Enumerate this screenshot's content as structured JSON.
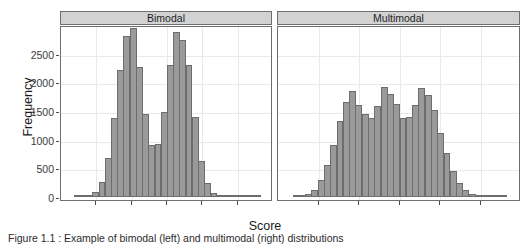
{
  "figure": {
    "x_axis_title": "Score",
    "y_axis_title": "Frequency",
    "caption": "Figure 1.1 : Example of bimodal (left) and multimodal (right) distributions",
    "colors": {
      "bar_fill": "#9a9a9a",
      "bar_border": "#6d6d6d",
      "strip_fill": "#d2d2d2",
      "panel_border": "#6e6e6e",
      "gridline": "#e9e9e9",
      "background": "#ffffff",
      "text": "#1a1a1a"
    }
  },
  "chart_data": {
    "type": "bar",
    "title": "",
    "xlabel": "Score",
    "ylabel": "Frequency",
    "ylim": [
      0,
      3000
    ],
    "yticks": [
      0,
      500,
      1000,
      1500,
      2000,
      2500
    ],
    "ytick_labels": [
      "0",
      "500",
      "1000",
      "1500",
      "2000",
      "2500"
    ],
    "xticks_labeled": false,
    "grid": true,
    "legend": "none",
    "facet_layout": "1 row x 2 columns",
    "panels": [
      {
        "label": "Bimodal",
        "n_bins": 30,
        "values": [
          10,
          15,
          30,
          80,
          265,
          675,
          1385,
          2220,
          2800,
          2940,
          2265,
          1440,
          915,
          925,
          1480,
          2305,
          2885,
          2745,
          2310,
          1390,
          630,
          240,
          75,
          25,
          10,
          5,
          5,
          3,
          2,
          2
        ]
      },
      {
        "label": "Multimodal",
        "n_bins": 34,
        "values": [
          10,
          25,
          60,
          130,
          300,
          560,
          905,
          1320,
          1655,
          1855,
          1600,
          1445,
          1380,
          1585,
          1920,
          1790,
          1625,
          1385,
          1400,
          1605,
          1905,
          1780,
          1510,
          1115,
          760,
          450,
          250,
          120,
          55,
          20,
          10,
          5,
          3,
          2
        ]
      }
    ]
  }
}
